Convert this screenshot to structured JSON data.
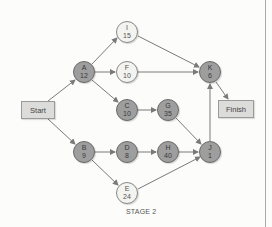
{
  "diagram": {
    "caption": "STAGE 2",
    "colors": {
      "critical_fill": "#9e9e9e",
      "noncritical_fill": "#f3f3f0",
      "box_fill": "#dcdcda",
      "edge": "#7a7a7a"
    },
    "start": {
      "label": "Start"
    },
    "finish": {
      "label": "Finish"
    },
    "nodes": {
      "I": {
        "name": "I",
        "value": "15",
        "critical": false
      },
      "A": {
        "name": "A",
        "value": "12",
        "critical": true
      },
      "F": {
        "name": "F",
        "value": "10",
        "critical": false
      },
      "K": {
        "name": "K",
        "value": "6",
        "critical": true
      },
      "C": {
        "name": "C",
        "value": "10",
        "critical": true
      },
      "G": {
        "name": "G",
        "value": "35",
        "critical": true
      },
      "B": {
        "name": "B",
        "value": "9",
        "critical": true
      },
      "D": {
        "name": "D",
        "value": "8",
        "critical": true
      },
      "H": {
        "name": "H",
        "value": "40",
        "critical": true
      },
      "J": {
        "name": "J",
        "value": "1",
        "critical": true
      },
      "E": {
        "name": "E",
        "value": "24",
        "critical": false
      }
    },
    "edges": [
      [
        "Start",
        "A"
      ],
      [
        "Start",
        "B"
      ],
      [
        "A",
        "I"
      ],
      [
        "A",
        "F"
      ],
      [
        "A",
        "C"
      ],
      [
        "I",
        "K"
      ],
      [
        "F",
        "K"
      ],
      [
        "C",
        "G"
      ],
      [
        "G",
        "J"
      ],
      [
        "B",
        "D"
      ],
      [
        "B",
        "E"
      ],
      [
        "D",
        "H"
      ],
      [
        "H",
        "J"
      ],
      [
        "E",
        "J"
      ],
      [
        "J",
        "K"
      ],
      [
        "K",
        "Finish"
      ]
    ]
  }
}
